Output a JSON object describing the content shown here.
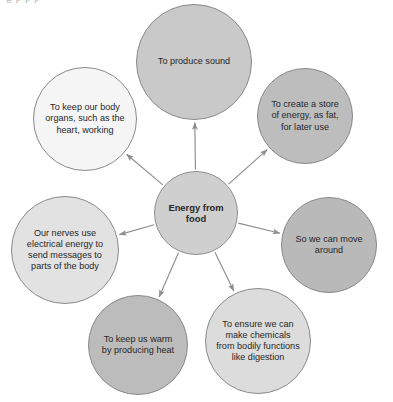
{
  "diagram": {
    "type": "radial-mind-map",
    "title_bleed": "g         p    p      p",
    "center": {
      "id": "center",
      "label": "Energy from\nfood",
      "cx": 196,
      "cy": 213,
      "r": 42,
      "fill": "#cfcfcf",
      "stroke": "#8e8e8e",
      "bold": true
    },
    "edge_color": "#8d8d8d",
    "satellites": [
      {
        "id": "produce-sound",
        "label": "To produce sound",
        "cx": 194,
        "cy": 62,
        "r": 58,
        "fill": "#c9c9c9",
        "stroke": "#8a8a8a"
      },
      {
        "id": "store-of-energy",
        "label": "To create a store\nof energy, as fat,\nfor later use",
        "cx": 305,
        "cy": 116,
        "r": 48,
        "fill": "#bdbdbd",
        "stroke": "#8a8a8a"
      },
      {
        "id": "move-around",
        "label": "So we can move\naround",
        "cx": 329,
        "cy": 245,
        "r": 48,
        "fill": "#b9b9b9",
        "stroke": "#8a8a8a"
      },
      {
        "id": "make-chemicals",
        "label": "To ensure we can\nmake chemicals\nfrom bodily functions\nlike digestion",
        "cx": 258,
        "cy": 341,
        "r": 53,
        "fill": "#dcdcdc",
        "stroke": "#8a8a8a"
      },
      {
        "id": "keep-us-warm",
        "label": "To keep us warm\nby producing heat",
        "cx": 138,
        "cy": 345,
        "r": 50,
        "fill": "#bcbcbc",
        "stroke": "#8a8a8a"
      },
      {
        "id": "nerves-messages",
        "label": "Our nerves use\nelectrical energy to\nsend messages to\nparts of the body",
        "cx": 65,
        "cy": 250,
        "r": 54,
        "fill": "#e2e2e2",
        "stroke": "#8a8a8a"
      },
      {
        "id": "body-organs",
        "label": "To keep our body\norgans, such as the\nheart, working",
        "cx": 85,
        "cy": 119,
        "r": 52,
        "fill": "#f5f5f5",
        "stroke": "#8a8a8a"
      }
    ]
  }
}
